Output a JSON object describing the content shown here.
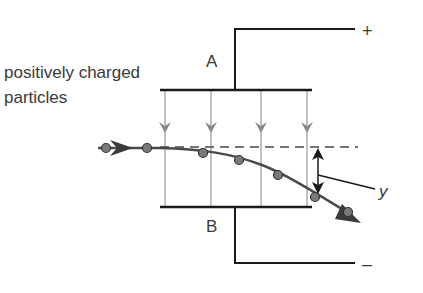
{
  "diagram": {
    "title_label": {
      "line1": "positively charged",
      "line2": "particles"
    },
    "plate_a_label": "A",
    "plate_b_label": "B",
    "positive_terminal": "+",
    "negative_terminal": "–",
    "deflection_label": "y",
    "colors": {
      "plate": "#1a1a1a",
      "field_line": "#9a9a9a",
      "particle_fill": "#7a7a7a",
      "path": "#4a4a4a",
      "text": "#3a3a3a"
    }
  }
}
